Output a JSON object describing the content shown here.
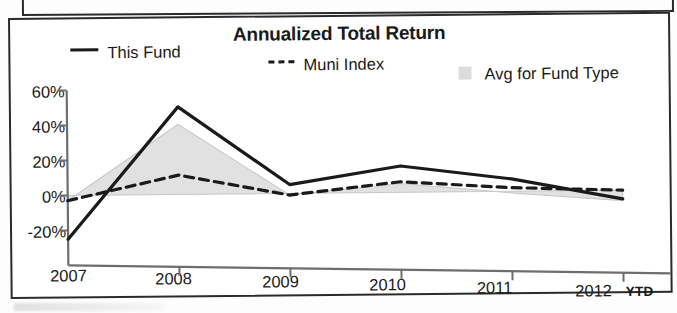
{
  "chart_data": {
    "type": "line",
    "title": "Annualized Total Return",
    "xlabel": "",
    "ylabel": "",
    "categories": [
      "2007",
      "2008",
      "2009",
      "2010",
      "2011",
      "2012"
    ],
    "x_axis_suffix": "YTD",
    "ytick_labels": [
      "60%",
      "40%",
      "20%",
      "0%",
      "-20%"
    ],
    "ytick_values": [
      60,
      40,
      20,
      0,
      -20
    ],
    "ylim": [
      -30,
      60
    ],
    "grid": false,
    "legend_position": "top",
    "series": [
      {
        "name": "This Fund",
        "style": "solid",
        "color": "#1a1a1a",
        "values": [
          -25,
          50,
          5,
          15,
          7,
          -5
        ]
      },
      {
        "name": "Muni Index",
        "style": "dashed",
        "color": "#1a1a1a",
        "values": [
          -3,
          11,
          -1,
          6,
          2,
          0
        ]
      },
      {
        "name": "Avg for Fund Type",
        "style": "area",
        "color": "#dcdcdc",
        "values": [
          -3,
          40,
          -1,
          5,
          -1,
          -6
        ]
      }
    ]
  },
  "legend": {
    "items": [
      {
        "label": "This Fund",
        "marker": "solid-line-marker"
      },
      {
        "label": "Muni Index",
        "marker": "dashed-line-marker"
      },
      {
        "label": "Avg for Fund Type",
        "marker": "gray-square-swatch"
      }
    ]
  },
  "axis": {
    "y": {
      "t0": "60%",
      "t1": "40%",
      "t2": "20%",
      "t3": "0%",
      "t4": "-20%"
    },
    "x": {
      "t0": "2007",
      "t1": "2008",
      "t2": "2009",
      "t3": "2010",
      "t4": "2011",
      "t5": "2012",
      "suffix": "YTD"
    }
  }
}
